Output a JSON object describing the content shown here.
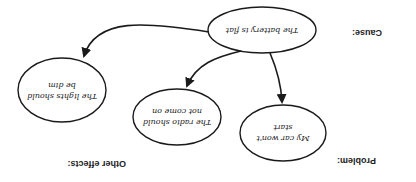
{
  "diagram": {
    "orientation": "rotated 180 degrees",
    "labels": {
      "cause": "Cause:",
      "problem": "Problem:",
      "other_effects": "Other effects:"
    },
    "nodes": {
      "cause": {
        "line1": "The battery is flat",
        "line2": ""
      },
      "problem": {
        "line1": "My car won't",
        "line2": "start"
      },
      "effect1": {
        "line1": "The radio should",
        "line2": "not come on"
      },
      "effect2": {
        "line1": "The lights should",
        "line2": "be dim"
      }
    },
    "edges": [
      {
        "from": "cause",
        "to": "problem"
      },
      {
        "from": "cause",
        "to": "effect1"
      },
      {
        "from": "cause",
        "to": "effect2"
      }
    ],
    "colors": {
      "stroke": "#1a1a1a",
      "background": "#ffffff"
    }
  }
}
